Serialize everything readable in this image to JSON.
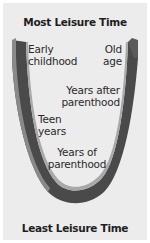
{
  "diagram": {
    "title_top": "Most Leisure Time",
    "title_bottom": "Least Leisure Time",
    "shape": "U-curve",
    "colors": {
      "background": "#ececec",
      "band_dark": "#4a4a4a",
      "band_light": "#9a9a9a",
      "text": "#1e1e1e"
    },
    "stages": [
      {
        "line1": "Early",
        "line2": "childhood",
        "position": "top-left"
      },
      {
        "line1": "Old",
        "line2": "age",
        "position": "top-right"
      },
      {
        "line1": "Years after",
        "line2": "parenthood",
        "position": "upper-right"
      },
      {
        "line1": "Teen",
        "line2": "years",
        "position": "middle-left"
      },
      {
        "line1": "Years of",
        "line2": "parenthood",
        "position": "bottom"
      }
    ]
  }
}
